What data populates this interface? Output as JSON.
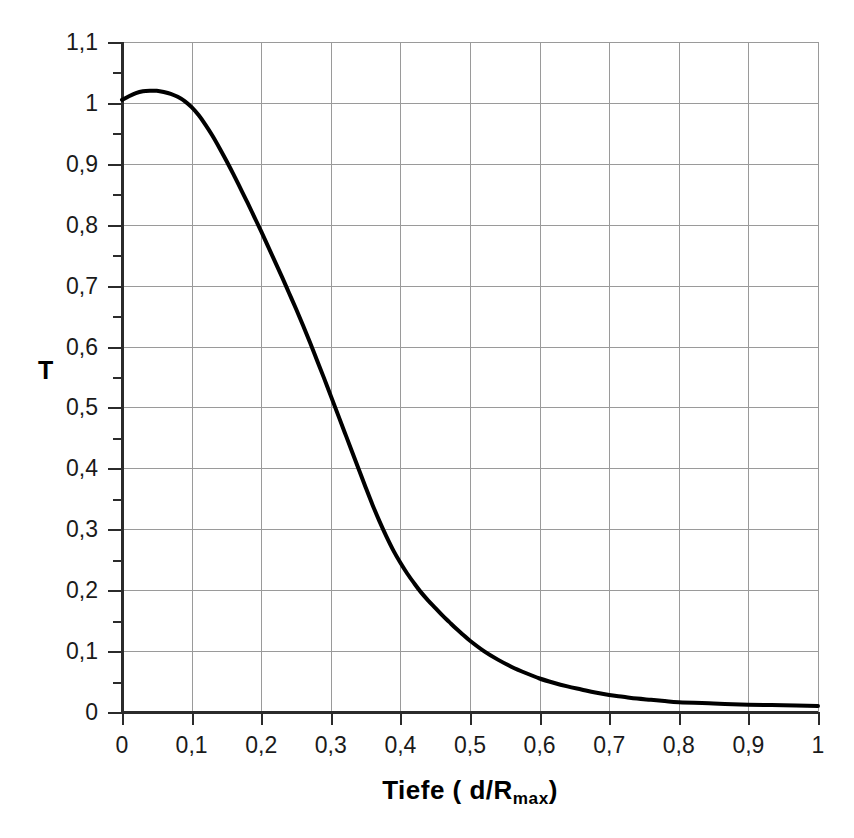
{
  "chart_data": {
    "type": "line",
    "title": "",
    "subtitle": "",
    "xlabel_text": "Tiefe ( d/R",
    "xlabel_sub": "max",
    "xlabel_tail": ")",
    "xlabel_plain": "Tiefe ( d/Rmax)",
    "ylabel": "T",
    "xlim": [
      0,
      1
    ],
    "ylim": [
      0,
      1.1
    ],
    "grid": true,
    "legend": "none",
    "x_major_step": 0.1,
    "y_major_step": 0.1,
    "y_minor_step": 0.05,
    "xticks": [
      0,
      0.1,
      0.2,
      0.3,
      0.4,
      0.5,
      0.6,
      0.7,
      0.8,
      0.9,
      1
    ],
    "yticks": [
      0,
      0.1,
      0.2,
      0.3,
      0.4,
      0.5,
      0.6,
      0.7,
      0.8,
      0.9,
      1,
      1.1
    ],
    "xtick_labels": [
      "0",
      "0,1",
      "0,2",
      "0,3",
      "0,4",
      "0,5",
      "0,6",
      "0,7",
      "0,8",
      "0,9",
      "1"
    ],
    "ytick_labels": [
      "0",
      "0,1",
      "0,2",
      "0,3",
      "0,4",
      "0,5",
      "0,6",
      "0,7",
      "0,8",
      "0,9",
      "1",
      "1,1"
    ],
    "series": [
      {
        "name": "T",
        "color": "#000000",
        "line_width": 4,
        "x": [
          0.0,
          0.01,
          0.02,
          0.03,
          0.04,
          0.05,
          0.06,
          0.07,
          0.08,
          0.09,
          0.1,
          0.11,
          0.12,
          0.13,
          0.14,
          0.15,
          0.16,
          0.17,
          0.18,
          0.19,
          0.2,
          0.21,
          0.22,
          0.23,
          0.24,
          0.25,
          0.26,
          0.27,
          0.28,
          0.29,
          0.3,
          0.31,
          0.32,
          0.33,
          0.34,
          0.35,
          0.36,
          0.37,
          0.38,
          0.39,
          0.4,
          0.41,
          0.42,
          0.43,
          0.44,
          0.45,
          0.46,
          0.47,
          0.48,
          0.49,
          0.5,
          0.52,
          0.54,
          0.56,
          0.58,
          0.6,
          0.62,
          0.64,
          0.66,
          0.68,
          0.7,
          0.72,
          0.74,
          0.76,
          0.78,
          0.8,
          0.85,
          0.9,
          0.95,
          1.0
        ],
        "y": [
          1.005,
          1.011,
          1.016,
          1.019,
          1.02,
          1.02,
          1.018,
          1.015,
          1.01,
          1.003,
          0.993,
          0.98,
          0.964,
          0.946,
          0.926,
          0.905,
          0.883,
          0.86,
          0.837,
          0.813,
          0.789,
          0.764,
          0.739,
          0.714,
          0.688,
          0.662,
          0.635,
          0.607,
          0.578,
          0.549,
          0.519,
          0.489,
          0.459,
          0.429,
          0.399,
          0.369,
          0.34,
          0.313,
          0.288,
          0.265,
          0.245,
          0.227,
          0.211,
          0.196,
          0.183,
          0.171,
          0.159,
          0.148,
          0.137,
          0.127,
          0.117,
          0.1,
          0.086,
          0.074,
          0.064,
          0.055,
          0.048,
          0.042,
          0.037,
          0.032,
          0.028,
          0.025,
          0.022,
          0.02,
          0.018,
          0.016,
          0.014,
          0.012,
          0.011,
          0.01
        ]
      }
    ],
    "colors": {
      "curve": "#000000",
      "axis": "#2b2b2b",
      "grid": "#9a9a9a",
      "background": "#ffffff",
      "text": "#1a1a1a"
    },
    "annotations": []
  }
}
